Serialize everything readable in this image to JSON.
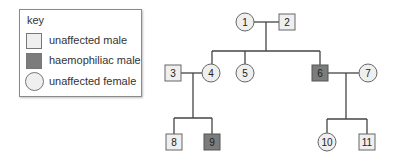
{
  "key": {
    "title": "key",
    "items": [
      {
        "label": "unaffected male",
        "shape": "square",
        "fill": "#efefef"
      },
      {
        "label": "haemophiliac male",
        "shape": "square",
        "fill": "#7c7c7c"
      },
      {
        "label": "unaffected female",
        "shape": "circle",
        "fill": "#efefef"
      }
    ]
  },
  "pedigree": {
    "individuals": [
      {
        "id": "1",
        "label": "1",
        "sex": "female",
        "affected": false,
        "generation": 1
      },
      {
        "id": "2",
        "label": "2",
        "sex": "male",
        "affected": false,
        "generation": 1
      },
      {
        "id": "3",
        "label": "3",
        "sex": "male",
        "affected": false,
        "generation": 2
      },
      {
        "id": "4",
        "label": "4",
        "sex": "female",
        "affected": false,
        "generation": 2
      },
      {
        "id": "5",
        "label": "5",
        "sex": "female",
        "affected": false,
        "generation": 2
      },
      {
        "id": "6",
        "label": "6",
        "sex": "male",
        "affected": true,
        "generation": 2
      },
      {
        "id": "7",
        "label": "7",
        "sex": "female",
        "affected": false,
        "generation": 2
      },
      {
        "id": "8",
        "label": "8",
        "sex": "male",
        "affected": false,
        "generation": 3
      },
      {
        "id": "9",
        "label": "9",
        "sex": "male",
        "affected": true,
        "generation": 3
      },
      {
        "id": "10",
        "label": "10",
        "sex": "female",
        "affected": false,
        "generation": 3
      },
      {
        "id": "11",
        "label": "11",
        "sex": "male",
        "affected": false,
        "generation": 3
      }
    ],
    "matings": [
      {
        "partners": [
          "1",
          "2"
        ],
        "children": [
          "4",
          "5",
          "6"
        ]
      },
      {
        "partners": [
          "3",
          "4"
        ],
        "children": [
          "8",
          "9"
        ]
      },
      {
        "partners": [
          "6",
          "7"
        ],
        "children": [
          "10",
          "11"
        ]
      }
    ]
  },
  "colors": {
    "unaffected_fill": "#efefef",
    "affected_fill": "#7c7c7c",
    "line": "#444444",
    "outline": "#777777"
  }
}
